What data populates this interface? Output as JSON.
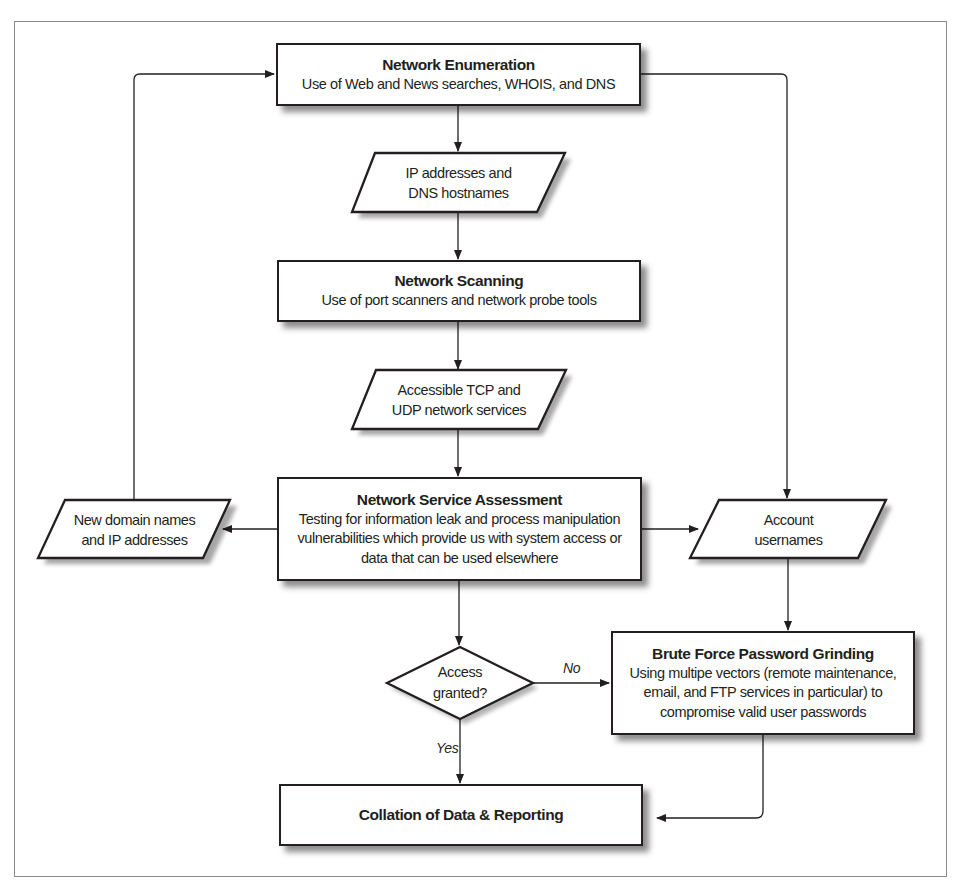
{
  "diagram": {
    "type": "flowchart",
    "nodes": {
      "network_enumeration": {
        "shape": "process",
        "title": "Network Enumeration",
        "desc": "Use of Web and News searches, WHOIS, and DNS"
      },
      "ip_addresses": {
        "shape": "data",
        "lines": [
          "IP addresses and",
          "DNS hostnames"
        ]
      },
      "network_scanning": {
        "shape": "process",
        "title": "Network Scanning",
        "desc": "Use of port scanners and network probe tools"
      },
      "accessible_services": {
        "shape": "data",
        "lines": [
          "Accessible TCP and",
          "UDP network services"
        ]
      },
      "network_service_assessment": {
        "shape": "process",
        "title": "Network Service Assessment",
        "desc_lines": [
          "Testing for information leak and process manipulation",
          "vulnerabilities which provide us with system access or",
          "data that can be used elsewhere"
        ]
      },
      "new_domain_names": {
        "shape": "data",
        "lines": [
          "New domain names",
          "and IP addresses"
        ]
      },
      "account_usernames": {
        "shape": "data",
        "lines": [
          "Account",
          "usernames"
        ]
      },
      "access_granted": {
        "shape": "decision",
        "lines": [
          "Access",
          "granted?"
        ]
      },
      "brute_force": {
        "shape": "process",
        "title": "Brute Force Password Grinding",
        "desc_lines": [
          "Using multipe vectors (remote maintenance,",
          "email, and FTP services in particular) to",
          "compromise valid user passwords"
        ]
      },
      "collation": {
        "shape": "process",
        "title": "Collation of Data & Reporting"
      }
    },
    "edge_labels": {
      "no": "No",
      "yes": "Yes"
    },
    "edges": [
      [
        "network_enumeration",
        "ip_addresses"
      ],
      [
        "ip_addresses",
        "network_scanning"
      ],
      [
        "network_scanning",
        "accessible_services"
      ],
      [
        "accessible_services",
        "network_service_assessment"
      ],
      [
        "network_service_assessment",
        "new_domain_names"
      ],
      [
        "new_domain_names",
        "network_enumeration"
      ],
      [
        "network_service_assessment",
        "account_usernames"
      ],
      [
        "network_enumeration",
        "account_usernames"
      ],
      [
        "account_usernames",
        "brute_force"
      ],
      [
        "network_service_assessment",
        "access_granted"
      ],
      [
        "access_granted",
        "brute_force",
        "No"
      ],
      [
        "access_granted",
        "collation",
        "Yes"
      ],
      [
        "brute_force",
        "collation"
      ]
    ],
    "colors": {
      "stroke": "#231f20",
      "frame": "#8a8a8a",
      "background": "#ffffff"
    }
  }
}
